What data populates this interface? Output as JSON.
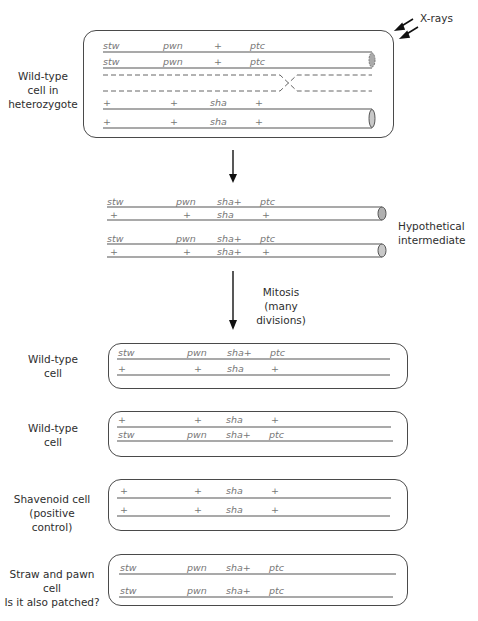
{
  "annotations": {
    "xrays": "X-rays",
    "mitosis": "Mitosis",
    "mitosis_sub": "(many divisions)"
  },
  "stages": {
    "heterozygote": {
      "label_lines": [
        "Wild-type",
        "cell in",
        "heterozygote"
      ],
      "rows": [
        [
          "stw",
          "pwn",
          "+",
          "ptc"
        ],
        [
          "stw",
          "pwn",
          "+",
          "ptc"
        ],
        [
          "+",
          "+",
          "sha",
          "+"
        ],
        [
          "+",
          "+",
          "sha",
          "+"
        ]
      ]
    },
    "intermediate": {
      "label_lines": [
        "Hypothetical",
        "intermediate"
      ],
      "rows": [
        [
          "stw",
          "pwn",
          "sha+",
          "ptc"
        ],
        [
          "+",
          "+",
          "sha",
          "+"
        ],
        [
          "stw",
          "pwn",
          "sha+",
          "ptc"
        ],
        [
          "+",
          "+",
          "sha+",
          "+"
        ]
      ]
    },
    "cells": [
      {
        "label_lines": [
          "Wild-type",
          "cell"
        ],
        "rows": [
          [
            "stw",
            "pwn",
            "sha+",
            "ptc"
          ],
          [
            "+",
            "+",
            "sha",
            "+"
          ]
        ]
      },
      {
        "label_lines": [
          "Wild-type",
          "cell"
        ],
        "rows": [
          [
            "+",
            "+",
            "sha",
            "+"
          ],
          [
            "stw",
            "pwn",
            "sha+",
            "ptc"
          ]
        ]
      },
      {
        "label_lines": [
          "Shavenoid cell",
          "(positive control)"
        ],
        "rows": [
          [
            "+",
            "+",
            "sha",
            "+"
          ],
          [
            "+",
            "+",
            "sha",
            "+"
          ]
        ]
      },
      {
        "label_lines": [
          "Straw and pawn cell",
          "Is it also patched?"
        ],
        "rows": [
          [
            "stw",
            "pwn",
            "sha+",
            "ptc"
          ],
          [
            "stw",
            "pwn",
            "sha+",
            "ptc"
          ]
        ]
      }
    ]
  },
  "colors": {
    "line": "#555555",
    "allele_text": "#777777",
    "centromere_fill": "#b0b0b0"
  }
}
